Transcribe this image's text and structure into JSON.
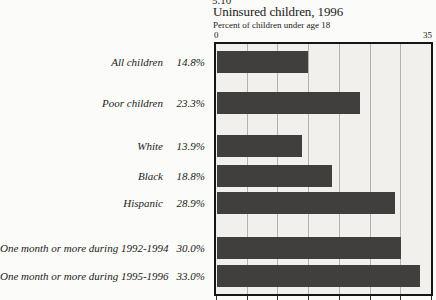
{
  "page": {
    "figure_number": "5.10"
  },
  "chart_data": {
    "type": "bar",
    "orientation": "horizontal",
    "title": "Uninsured children, 1996",
    "subtitle": "Percent of children under age 18",
    "categories": [
      "All children",
      "Poor children",
      "White",
      "Black",
      "Hispanic",
      "One month or more during 1992-1994",
      "One month or more during 1995-1996"
    ],
    "values": [
      14.8,
      23.3,
      13.9,
      18.8,
      28.9,
      30.0,
      33.0
    ],
    "value_labels": [
      "14.8%",
      "23.3%",
      "13.9%",
      "18.8%",
      "28.9%",
      "30.0%",
      "33.0%"
    ],
    "xlabel": "",
    "ylabel": "",
    "axis": {
      "min": 0,
      "max": 35,
      "min_label": "0",
      "max_label": "35",
      "gridlines": [
        5,
        10,
        15,
        20,
        25,
        30
      ],
      "tick_marks": [
        0,
        5,
        10,
        15,
        20,
        25,
        30,
        35
      ]
    },
    "grid": "vertical",
    "legend": "none",
    "colors": {
      "bar": "#403f3d",
      "plot_background": "#f1f0ec",
      "gridline": "#b2b2ae",
      "frame": "#161614",
      "text": "#1e1e1c"
    }
  }
}
